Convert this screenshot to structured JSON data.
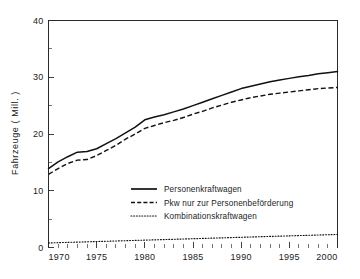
{
  "chart_data": {
    "type": "line",
    "title": "",
    "xlabel": "",
    "ylabel": "Fahrzeuge  ( Mill. )",
    "xlim": [
      1970,
      2000
    ],
    "ylim": [
      0,
      40
    ],
    "grid": false,
    "legend_position": "inside-lower-center",
    "x_tick_labels": [
      "1970",
      "1975",
      "1980",
      "1985",
      "1990",
      "1995",
      "2000"
    ],
    "x_ticks": [
      1970,
      1975,
      1980,
      1985,
      1990,
      1995,
      2000
    ],
    "x_minor_step": 1,
    "y_tick_labels": [
      "0",
      "10",
      "20",
      "30",
      "40"
    ],
    "y_ticks": [
      0,
      10,
      20,
      30,
      40
    ],
    "y_minor_ticks": [
      5,
      15,
      25,
      35
    ],
    "x": [
      1970,
      1971,
      1972,
      1973,
      1974,
      1975,
      1976,
      1977,
      1978,
      1979,
      1980,
      1981,
      1982,
      1983,
      1984,
      1985,
      1986,
      1987,
      1988,
      1989,
      1990,
      1991,
      1992,
      1993,
      1994,
      1995,
      1996,
      1997,
      1998,
      1999,
      2000
    ],
    "series": [
      {
        "name": "Personenkraftwagen",
        "style": "solid",
        "values": [
          13.9,
          15.1,
          16.0,
          16.8,
          16.9,
          17.4,
          18.3,
          19.2,
          20.2,
          21.2,
          22.5,
          23.0,
          23.4,
          23.9,
          24.4,
          25.0,
          25.6,
          26.2,
          26.8,
          27.4,
          28.0,
          28.4,
          28.8,
          29.2,
          29.5,
          29.8,
          30.1,
          30.3,
          30.6,
          30.8,
          31.0
        ],
        "units": "Mill."
      },
      {
        "name": "Pkw nur zur Personenbeförderung",
        "style": "dashed",
        "values": [
          12.9,
          13.9,
          14.8,
          15.4,
          15.5,
          16.2,
          17.1,
          18.0,
          19.1,
          20.0,
          21.0,
          21.5,
          22.0,
          22.4,
          22.9,
          23.5,
          24.0,
          24.6,
          25.1,
          25.6,
          26.0,
          26.4,
          26.7,
          27.0,
          27.2,
          27.4,
          27.6,
          27.8,
          28.0,
          28.1,
          28.2
        ],
        "units": "Mill."
      },
      {
        "name": "Kombinationskraftwagen",
        "style": "dotted",
        "values": [
          0.8,
          0.85,
          0.9,
          0.95,
          1.0,
          1.05,
          1.1,
          1.15,
          1.2,
          1.25,
          1.3,
          1.35,
          1.4,
          1.45,
          1.5,
          1.55,
          1.6,
          1.65,
          1.7,
          1.75,
          1.8,
          1.85,
          1.9,
          1.95,
          2.0,
          2.05,
          2.1,
          2.15,
          2.2,
          2.25,
          2.3
        ],
        "units": "Mill."
      }
    ],
    "colors": {
      "axis": "#2b2b2b",
      "line": "#111111",
      "background": "#ffffff",
      "text": "#222222"
    }
  },
  "legend": {
    "entries": [
      {
        "label": "Personenkraftwagen",
        "style": "solid"
      },
      {
        "label": "Pkw nur zur Personenbeförderung",
        "style": "dashed"
      },
      {
        "label": "Kombinationskraftwagen",
        "style": "dotted"
      }
    ]
  },
  "axes": {
    "y_title": "Fahrzeuge  ( Mill. )"
  }
}
